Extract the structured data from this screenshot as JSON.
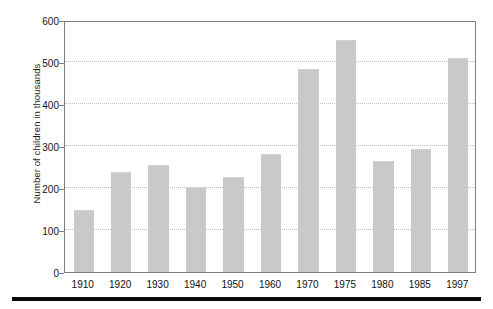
{
  "chart_data": {
    "type": "bar",
    "title": "",
    "subtitle": "",
    "xlabel": "",
    "ylabel": "Number of children in thousands",
    "categories": [
      "1910",
      "1920",
      "1930",
      "1940",
      "1950",
      "1960",
      "1970",
      "1975",
      "1980",
      "1985",
      "1997"
    ],
    "values": [
      145,
      235,
      252,
      200,
      223,
      278,
      482,
      550,
      262,
      290,
      507
    ],
    "ylim": [
      0,
      600
    ],
    "yticks": [
      0,
      100,
      200,
      300,
      400,
      500,
      600
    ],
    "ytick_labels": [
      "0",
      "100",
      "200",
      "300",
      "400",
      "500",
      "600"
    ],
    "grid": true,
    "grid_axis": "y",
    "legend": false,
    "legend_position": "none",
    "bar_color": "#c9c9c9",
    "axis_color": "#7d7d7d",
    "grid_color": "#bdbdbd",
    "text_color": "#111111",
    "background": "#ffffff"
  },
  "figure": {
    "bottom_rule_color": "#0a0a0a"
  }
}
